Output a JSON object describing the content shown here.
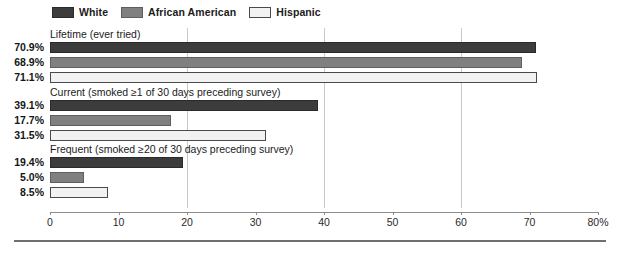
{
  "legend": {
    "items": [
      {
        "label": "White",
        "color": "#3c3c3c",
        "border": "#2a2a2a"
      },
      {
        "label": "African American",
        "color": "#808080",
        "border": "#5e5e5e"
      },
      {
        "label": "Hispanic",
        "color": "#f2f2f2",
        "border": "#4a4a4a"
      }
    ]
  },
  "axis": {
    "ticks": [
      "0",
      "10",
      "20",
      "30",
      "40",
      "50",
      "60",
      "70",
      "80%"
    ],
    "tick_values": [
      0,
      10,
      20,
      30,
      40,
      50,
      60,
      70,
      80
    ],
    "gridlines": [
      20,
      40,
      60
    ]
  },
  "groups": [
    {
      "title": "Lifetime (ever tried)",
      "bars": [
        {
          "series": "White",
          "label": "70.9%",
          "value": 70.9
        },
        {
          "series": "African American",
          "label": "68.9%",
          "value": 68.9
        },
        {
          "series": "Hispanic",
          "label": "71.1%",
          "value": 71.1
        }
      ]
    },
    {
      "title": "Current (smoked  ≥1 of 30 days preceding survey)",
      "bars": [
        {
          "series": "White",
          "label": "39.1%",
          "value": 39.1
        },
        {
          "series": "African American",
          "label": "17.7%",
          "value": 17.7
        },
        {
          "series": "Hispanic",
          "label": "31.5%",
          "value": 31.5
        }
      ]
    },
    {
      "title": "Frequent (smoked  ≥20 of 30 days preceding survey)",
      "bars": [
        {
          "series": "White",
          "label": "19.4%",
          "value": 19.4
        },
        {
          "series": "African American",
          "label": "5.0%",
          "value": 5.0
        },
        {
          "series": "Hispanic",
          "label": "8.5%",
          "value": 8.5
        }
      ]
    }
  ],
  "chart_data": {
    "type": "bar",
    "orientation": "horizontal",
    "title": "",
    "xlabel": "",
    "ylabel": "",
    "xlim": [
      0,
      80
    ],
    "xticks": [
      0,
      10,
      20,
      30,
      40,
      50,
      60,
      70,
      80
    ],
    "xticklabels": [
      "0",
      "10",
      "20",
      "30",
      "40",
      "50",
      "60",
      "70",
      "80%"
    ],
    "grid": "vertical gridlines at 20, 40, 60",
    "legend_position": "top-left",
    "categories": [
      "Lifetime (ever tried)",
      "Current (smoked ≥1 of 30 days preceding survey)",
      "Frequent (smoked ≥20 of 30 days preceding survey)"
    ],
    "series": [
      {
        "name": "White",
        "color": "#3c3c3c",
        "values": [
          70.9,
          39.1,
          19.4
        ]
      },
      {
        "name": "African American",
        "color": "#808080",
        "values": [
          68.9,
          17.7,
          5.0
        ]
      },
      {
        "name": "Hispanic",
        "color": "#f2f2f2",
        "values": [
          71.1,
          31.5,
          8.5
        ]
      }
    ],
    "data_labels": [
      [
        "70.9%",
        "68.9%",
        "71.1%"
      ],
      [
        "39.1%",
        "17.7%",
        "31.5%"
      ],
      [
        "19.4%",
        "5.0%",
        "8.5%"
      ]
    ]
  }
}
